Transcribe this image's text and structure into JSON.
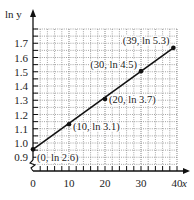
{
  "chart_data": {
    "type": "line",
    "title": "",
    "xlabel": "x",
    "ylabel": "ln y",
    "xlim": [
      0,
      40
    ],
    "ylim": [
      0.8,
      1.8
    ],
    "y_axis_break": true,
    "grid": true,
    "x_ticks": [
      0,
      10,
      20,
      30,
      40
    ],
    "x_tick_labels": [
      "0",
      "10",
      "20",
      "30",
      "40"
    ],
    "y_ticks": [
      0.9,
      1.0,
      1.1,
      1.2,
      1.3,
      1.4,
      1.5,
      1.6,
      1.7
    ],
    "y_tick_labels": [
      "0.9",
      "1.0",
      "1.1",
      "1.2",
      "1.3",
      "1.4",
      "1.5",
      "1.6",
      "1.7"
    ],
    "series": [
      {
        "name": "ln y vs x",
        "points": [
          {
            "x": 0,
            "y": 0.9555,
            "label": "(0, ln 2.6)"
          },
          {
            "x": 10,
            "y": 1.1314,
            "label": "(10, ln 3.1)"
          },
          {
            "x": 20,
            "y": 1.3083,
            "label": "(20, ln 3.7)"
          },
          {
            "x": 30,
            "y": 1.5041,
            "label": "(30, ln 4.5)"
          },
          {
            "x": 39,
            "y": 1.6677,
            "label": "(39, ln 5.3)"
          }
        ]
      }
    ]
  }
}
